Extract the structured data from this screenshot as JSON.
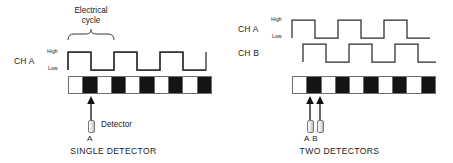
{
  "diagram": {
    "title_visible": false,
    "stroke_color": "#2b2b2b",
    "strip_black": "#141414",
    "strip_white": "#ffffff"
  },
  "panels": [
    {
      "id": "single",
      "caption": "SINGLE DETECTOR",
      "annotation": {
        "text_line1": "Electrical",
        "text_line2": "cycle"
      },
      "channels": [
        {
          "name": "CH A",
          "high_label": "High",
          "low_label": "Low",
          "pulses": 4,
          "phase_deg": 0
        }
      ],
      "strip": {
        "segments": 10,
        "pattern": [
          "w",
          "b",
          "w",
          "b",
          "w",
          "b",
          "w",
          "b",
          "w",
          "b"
        ]
      },
      "detectors": [
        {
          "label": "A",
          "caption": "Detector"
        }
      ]
    },
    {
      "id": "two",
      "caption": "TWO DETECTORS",
      "channels": [
        {
          "name": "CH A",
          "high_label": "High",
          "low_label": "Low",
          "pulses": 4,
          "phase_deg": 0
        },
        {
          "name": "CH B",
          "high_label": "",
          "low_label": "",
          "pulses": 4,
          "phase_deg": 90
        }
      ],
      "strip": {
        "segments": 10,
        "pattern": [
          "w",
          "b",
          "w",
          "b",
          "w",
          "b",
          "w",
          "b",
          "w",
          "b"
        ]
      },
      "detectors": [
        {
          "label": "A"
        },
        {
          "label": "B"
        }
      ],
      "detector_labels": "A B"
    }
  ]
}
